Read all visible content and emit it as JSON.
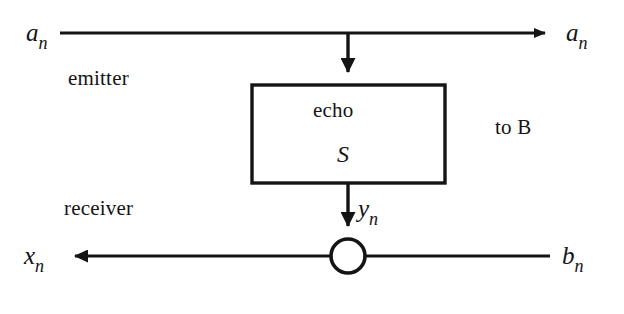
{
  "diagram": {
    "line_color": "#141414",
    "background": "#ffffff",
    "labels": {
      "a_in": {
        "base": "a",
        "sub": "n"
      },
      "a_out": {
        "base": "a",
        "sub": "n"
      },
      "x_out": {
        "base": "x",
        "sub": "n"
      },
      "b_in": {
        "base": "b",
        "sub": "n"
      },
      "y": {
        "base": "y",
        "sub": "n"
      },
      "emitter": "emitter",
      "receiver": "receiver",
      "to_b": "to B",
      "echo": "echo",
      "s": "S"
    },
    "block": {
      "name": "echo-block",
      "line1": "echo",
      "line2": "S",
      "x": 252,
      "y": 85,
      "width": 193,
      "height": 98
    },
    "adder": {
      "name": "summing-junction",
      "cx": 348,
      "cy": 256,
      "r": 17
    },
    "connections": [
      {
        "name": "emitter-path",
        "from": "a_in",
        "to": "a_out",
        "y": 33,
        "arrow": "right"
      },
      {
        "name": "echo-tap-path",
        "from": "a-line",
        "to": "echo-block",
        "x": 348,
        "arrow": "down"
      },
      {
        "name": "echo-output-path",
        "from": "echo-block",
        "to": "summing-junction",
        "x": 348,
        "arrow": "down"
      },
      {
        "name": "receiver-path",
        "from": "summing-junction",
        "to": "x_out",
        "y": 256,
        "arrow": "left"
      },
      {
        "name": "far-end-path",
        "from": "b_in",
        "to": "summing-junction",
        "y": 256,
        "arrow": "none"
      }
    ]
  }
}
